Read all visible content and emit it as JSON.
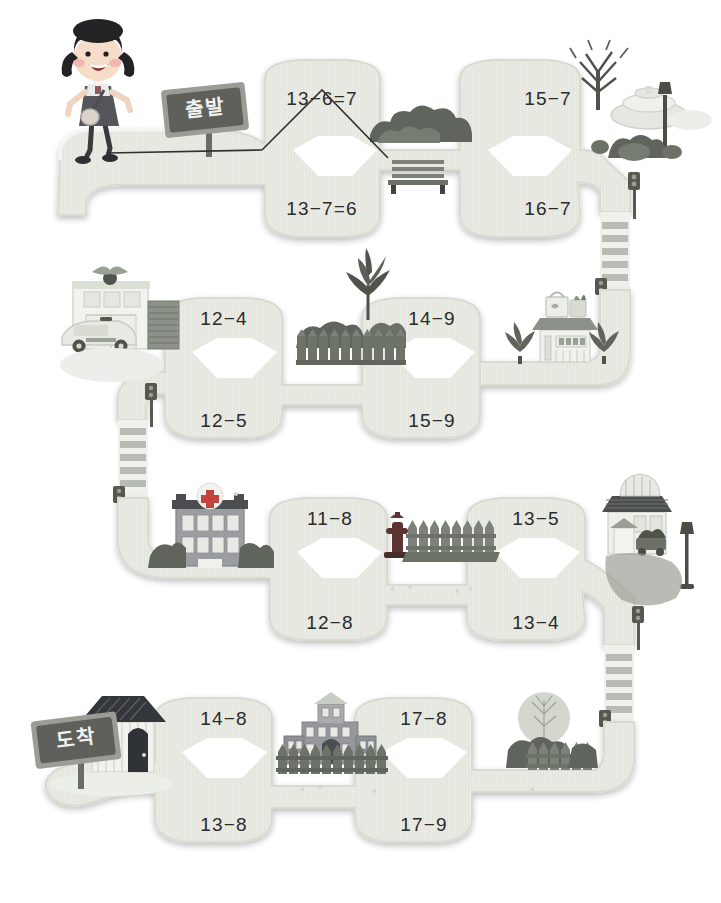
{
  "worksheet": {
    "title": "Subtraction Maze",
    "start_sign_label": "출발",
    "goal_sign_label": "도착",
    "character": "schoolgirl-walking",
    "answer_path_drawn": true
  },
  "colors": {
    "road_fill": "#e9eae4",
    "road_edge": "#d6d8cf",
    "road_shadow": "#dcdfd5",
    "text": "#2b2b2b",
    "sign_board": "#6e6f6a",
    "sign_frame": "#8d8e87",
    "bush_dark": "#5c6159",
    "bush_mid": "#7b8179",
    "fence": "#8a8f86",
    "hospital_red": "#c2443d",
    "hydrant_red": "#7a3b3b",
    "crosswalk_stripe": "#b9bcb4",
    "pencil_line": "#30302e",
    "page_background": "#ffffff"
  },
  "rows": [
    {
      "id": "row-1",
      "scenery_left": "start-sign",
      "scenery_mid": "bushes-and-bench",
      "scenery_right": "bare-tree-and-fountain-and-streetlamp",
      "cells": [
        {
          "id": "r1c1-top",
          "label": "13−6=7",
          "position": "top-left"
        },
        {
          "id": "r1c1-bottom",
          "label": "13−7=6",
          "position": "bottom-left"
        },
        {
          "id": "r1c2-top",
          "label": "15−7",
          "position": "top-right"
        },
        {
          "id": "r1c2-bottom",
          "label": "16−7",
          "position": "bottom-right"
        }
      ]
    },
    {
      "id": "row-2",
      "scenery_left": "police-station-and-police-car",
      "scenery_mid": "pine-tree-and-fence",
      "scenery_right": "grocery-store-and-pine-trees",
      "cells": [
        {
          "id": "r2c1-top",
          "label": "12−4",
          "position": "top-left"
        },
        {
          "id": "r2c1-bottom",
          "label": "12−5",
          "position": "bottom-left"
        },
        {
          "id": "r2c2-top",
          "label": "14−9",
          "position": "top-right"
        },
        {
          "id": "r2c2-bottom",
          "label": "15−9",
          "position": "bottom-right"
        }
      ]
    },
    {
      "id": "row-3",
      "scenery_left": "hospital-building",
      "scenery_mid": "fire-hydrant-and-fence",
      "scenery_right": "flower-shop-and-streetlamp",
      "cells": [
        {
          "id": "r3c1-top",
          "label": "11−8",
          "position": "top-left"
        },
        {
          "id": "r3c1-bottom",
          "label": "12−8",
          "position": "bottom-left"
        },
        {
          "id": "r3c2-top",
          "label": "13−5",
          "position": "top-right"
        },
        {
          "id": "r3c2-bottom",
          "label": "13−4",
          "position": "bottom-right"
        }
      ]
    },
    {
      "id": "row-4",
      "scenery_left": "goal-sign-and-house",
      "scenery_mid": "school-building-and-fence",
      "scenery_right": "round-tree-and-fence",
      "cells": [
        {
          "id": "r4c1-top",
          "label": "14−8",
          "position": "top-left"
        },
        {
          "id": "r4c1-bottom",
          "label": "13−8",
          "position": "bottom-left"
        },
        {
          "id": "r4c2-top",
          "label": "17−8",
          "position": "top-right"
        },
        {
          "id": "r4c2-bottom",
          "label": "17−9",
          "position": "bottom-right"
        }
      ]
    }
  ],
  "crosswalks": [
    {
      "id": "crosswalk-1",
      "location": "right-between-row1-row2",
      "stripes": 6
    },
    {
      "id": "crosswalk-2",
      "location": "left-between-row2-row3",
      "stripes": 6
    },
    {
      "id": "crosswalk-3",
      "location": "right-between-row3-row4",
      "stripes": 6
    }
  ],
  "traffic_lights": [
    {
      "id": "traffic-light-1",
      "location": "row1-right-top"
    },
    {
      "id": "traffic-light-2",
      "location": "row2-right-top"
    },
    {
      "id": "traffic-light-3",
      "location": "row2-left-top"
    },
    {
      "id": "traffic-light-4",
      "location": "row3-left-top"
    },
    {
      "id": "traffic-light-5",
      "location": "row3-right-bottom"
    },
    {
      "id": "traffic-light-6",
      "location": "row4-right-top"
    }
  ]
}
